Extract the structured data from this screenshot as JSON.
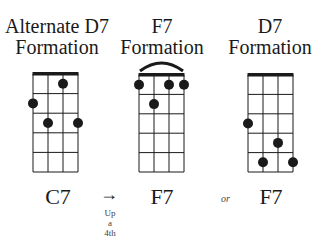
{
  "diagrams": [
    {
      "title_line1": "Alternate D7",
      "title_line2": "Formation",
      "chord_label": "C7",
      "frets_shown": 5,
      "strings": 4,
      "barre": false,
      "dots": [
        {
          "string": 2,
          "fret": 1
        },
        {
          "string": 0,
          "fret": 2
        },
        {
          "string": 1,
          "fret": 3
        },
        {
          "string": 3,
          "fret": 3
        }
      ]
    },
    {
      "title_line1": "F7",
      "title_line2": "Formation",
      "chord_label": "F7",
      "frets_shown": 5,
      "strings": 4,
      "barre": true,
      "dots": [
        {
          "string": 0,
          "fret": 1
        },
        {
          "string": 2,
          "fret": 1
        },
        {
          "string": 3,
          "fret": 1
        },
        {
          "string": 1,
          "fret": 2
        }
      ]
    },
    {
      "title_line1": "D7",
      "title_line2": "Formation",
      "chord_label": "F7",
      "frets_shown": 5,
      "strings": 4,
      "barre": false,
      "dots": [
        {
          "string": 0,
          "fret": 3
        },
        {
          "string": 2,
          "fret": 4
        },
        {
          "string": 1,
          "fret": 5
        },
        {
          "string": 3,
          "fret": 5
        }
      ]
    }
  ],
  "transition": {
    "arrow": "→",
    "note_line1": "Up",
    "note_line2": "a",
    "note_line3": "4th"
  },
  "connector": "or",
  "colors": {
    "ink": "#1a1a1a",
    "background": "#ffffff"
  }
}
